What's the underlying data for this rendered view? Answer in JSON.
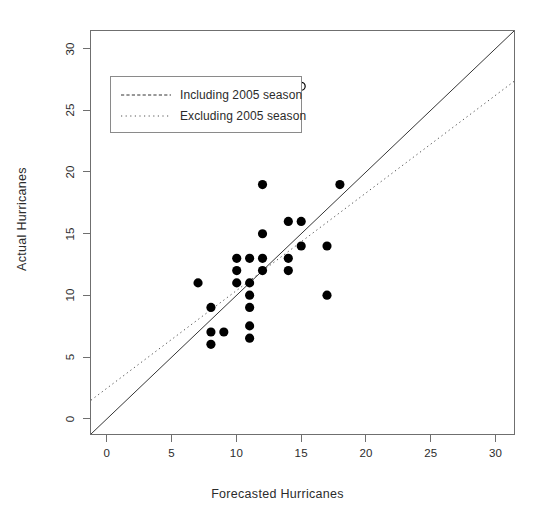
{
  "chart_data": {
    "type": "scatter",
    "title": "",
    "xlabel": "Forecasted Hurricanes",
    "ylabel": "Actual Hurricanes",
    "xlim": [
      -1.3,
      31.5
    ],
    "ylim": [
      -1.3,
      31.5
    ],
    "xticks": [
      0,
      5,
      10,
      15,
      20,
      25,
      30
    ],
    "yticks": [
      0,
      5,
      10,
      15,
      20,
      25,
      30
    ],
    "xtick_labels": [
      "0",
      "5",
      "10",
      "15",
      "20",
      "25",
      "30"
    ],
    "ytick_labels": [
      "0",
      "5",
      "10",
      "15",
      "20",
      "25",
      "30"
    ],
    "grid": false,
    "legend_position": "upper left",
    "series": [
      {
        "name": "Observations",
        "marker": "filled-circle",
        "color": "#000000",
        "points": [
          {
            "x": 7,
            "y": 11
          },
          {
            "x": 8,
            "y": 9
          },
          {
            "x": 8,
            "y": 7
          },
          {
            "x": 8,
            "y": 6
          },
          {
            "x": 9,
            "y": 7
          },
          {
            "x": 10,
            "y": 13
          },
          {
            "x": 10,
            "y": 12
          },
          {
            "x": 10,
            "y": 11
          },
          {
            "x": 11,
            "y": 13
          },
          {
            "x": 11,
            "y": 11
          },
          {
            "x": 11,
            "y": 10
          },
          {
            "x": 11,
            "y": 9
          },
          {
            "x": 11,
            "y": 7.5
          },
          {
            "x": 11,
            "y": 6.5
          },
          {
            "x": 12,
            "y": 19
          },
          {
            "x": 12,
            "y": 15
          },
          {
            "x": 12,
            "y": 13
          },
          {
            "x": 12,
            "y": 12
          },
          {
            "x": 14,
            "y": 16
          },
          {
            "x": 14,
            "y": 13
          },
          {
            "x": 14,
            "y": 12
          },
          {
            "x": 15,
            "y": 16
          },
          {
            "x": 15,
            "y": 14
          },
          {
            "x": 17,
            "y": 14
          },
          {
            "x": 17,
            "y": 10
          },
          {
            "x": 18,
            "y": 19
          }
        ]
      },
      {
        "name": "2005 season outlier",
        "marker": "open-circle",
        "color": "#000000",
        "points": [
          {
            "x": 15,
            "y": 27
          }
        ]
      }
    ],
    "lines": [
      {
        "name": "Including 2005 season",
        "style": "solid",
        "color": "#333333",
        "x0": -1.3,
        "y0": -1.3,
        "x1": 31.5,
        "y1": 31.5
      },
      {
        "name": "Excluding 2005 season",
        "style": "dotted",
        "color": "#555555",
        "x0": -1.3,
        "y0": 1.45,
        "x1": 31.5,
        "y1": 27.4
      }
    ]
  },
  "legend": {
    "entries": [
      {
        "label": "Including 2005 season",
        "style": "solid"
      },
      {
        "label": "Excluding 2005 season",
        "style": "dotted"
      }
    ]
  }
}
